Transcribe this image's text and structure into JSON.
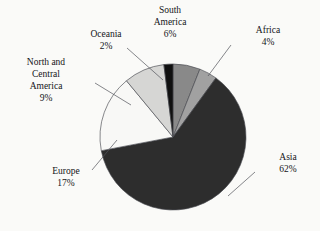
{
  "figure": {
    "background_color": "#fdfdfb",
    "text_color": "#15161a",
    "leader_color": "#53555c",
    "outline_color": "#4a4c52"
  },
  "chart_data": {
    "type": "pie",
    "title": "",
    "subtitle": "",
    "xlabel": "",
    "ylabel": "",
    "legend_position": "none",
    "grid": false,
    "labels_outside": true,
    "units": "percent",
    "total": 100,
    "start_angle_deg": 0,
    "direction": "clockwise",
    "categories": [
      "South America",
      "Africa",
      "Asia",
      "Europe",
      "North and Central America",
      "Oceania"
    ],
    "values": [
      6,
      4,
      62,
      17,
      9,
      2
    ],
    "slices": [
      {
        "name": "South America",
        "label_lines": [
          "South",
          "America"
        ],
        "value": 6,
        "value_label": "6%",
        "color": "#8b8b8b",
        "start_deg": 0,
        "end_deg": 21.6,
        "has_leader": false
      },
      {
        "name": "Africa",
        "label_lines": [
          "Africa"
        ],
        "value": 4,
        "value_label": "4%",
        "color": "#a3a3a3",
        "start_deg": 21.6,
        "end_deg": 36.0,
        "has_leader": true
      },
      {
        "name": "Asia",
        "label_lines": [
          "Asia"
        ],
        "value": 62,
        "value_label": "62%",
        "color": "#2e2e2e",
        "start_deg": 36.0,
        "end_deg": 259.2,
        "has_leader": true
      },
      {
        "name": "Europe",
        "label_lines": [
          "Europe"
        ],
        "value": 17,
        "value_label": "17%",
        "color": "#fbfbf9",
        "start_deg": 259.2,
        "end_deg": 320.4,
        "has_leader": true
      },
      {
        "name": "North and Central America",
        "label_lines": [
          "North and",
          "Central",
          "America"
        ],
        "value": 9,
        "value_label": "9%",
        "color": "#d9d9d7",
        "start_deg": 320.4,
        "end_deg": 352.8,
        "has_leader": true
      },
      {
        "name": "Oceania",
        "label_lines": [
          "Oceania"
        ],
        "value": 2,
        "value_label": "2%",
        "color": "#111111",
        "start_deg": 352.8,
        "end_deg": 360.0,
        "has_leader": true
      }
    ]
  },
  "labels": {
    "south_america": {
      "line1": "South",
      "line2": "America",
      "pct": "6%"
    },
    "africa": {
      "line1": "Africa",
      "pct": "4%"
    },
    "asia": {
      "line1": "Asia",
      "pct": "62%"
    },
    "europe": {
      "line1": "Europe",
      "pct": "17%"
    },
    "north_central_america": {
      "line1": "North and",
      "line2": "Central",
      "line3": "America",
      "pct": "9%"
    },
    "oceania": {
      "line1": "Oceania",
      "pct": "2%"
    }
  }
}
